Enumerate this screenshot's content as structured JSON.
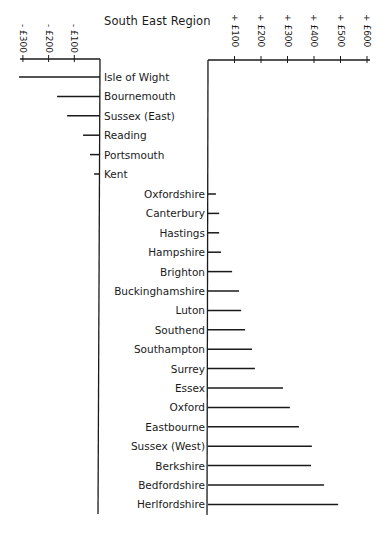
{
  "chart_data": {
    "type": "bar",
    "orientation": "horizontal-diverging",
    "title": "South East Region",
    "xlabel": "",
    "ylabel": "",
    "grid": false,
    "legend": null,
    "series": [
      {
        "name": "Negative (left axis)",
        "direction": "left",
        "axis_ticks": [
          "- £300",
          "- £200",
          "- £100"
        ],
        "axis_tick_values": [
          -300,
          -200,
          -100
        ],
        "categories": [
          "Isle of Wight",
          "Bournemouth",
          "Sussex (East)",
          "Reading",
          "Portsmouth",
          "Kent"
        ],
        "values": [
          -315,
          -167,
          -128,
          -66,
          -39,
          -23
        ]
      },
      {
        "name": "Positive (right axis)",
        "direction": "right",
        "axis_ticks": [
          "+ £100",
          "+ £200",
          "+ £300",
          "+ £400",
          "+ £500",
          "+ £600"
        ],
        "axis_tick_values": [
          100,
          200,
          300,
          400,
          500,
          600
        ],
        "categories": [
          "Oxfordshire",
          "Canterbury",
          "Hastings",
          "Hampshire",
          "Brighton",
          "Buckinghamshire",
          "Luton",
          "Southend",
          "Southampton",
          "Surrey",
          "Essex",
          "Oxford",
          "Eastbourne",
          "Sussex (West)",
          "Berkshire",
          "Bedfordshire",
          "Herlfordshire"
        ],
        "values": [
          30,
          42,
          42,
          49,
          91,
          117,
          125,
          140,
          166,
          177,
          283,
          309,
          343,
          392,
          389,
          438,
          491
        ]
      }
    ],
    "xlim_left": [
      -300,
      0
    ],
    "xlim_right": [
      0,
      600
    ]
  }
}
